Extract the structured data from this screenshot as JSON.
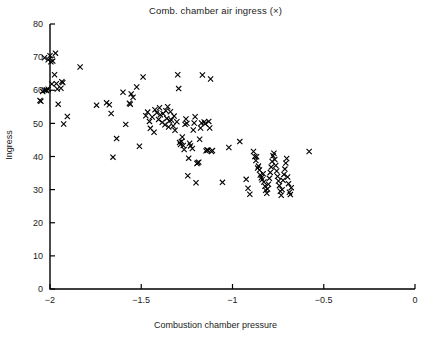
{
  "chart_data": {
    "type": "scatter",
    "title": "Comb. chamber air ingress (×)",
    "xlabel": "Combustion chamber pressure",
    "ylabel": "Ingress",
    "xlim": [
      -2.1,
      0
    ],
    "ylim": [
      0,
      80
    ],
    "xticks": [
      -2,
      -1.5,
      -1,
      -0.5,
      0
    ],
    "xtick_labels": [
      "−2",
      "−1.5",
      "−1",
      "−0.5",
      "0"
    ],
    "yticks": [
      0,
      10,
      20,
      30,
      40,
      50,
      60,
      70,
      80
    ],
    "ytick_labels": [
      "0",
      "10",
      "20",
      "30",
      "40",
      "50",
      "60",
      "70",
      "80"
    ],
    "grid": false,
    "legend": null,
    "marker": "x",
    "marker_color": "#000000",
    "axis_color": "#000000",
    "series": [
      {
        "name": "Comb. chamber air ingress",
        "points": [
          [
            -2.05,
            56.7
          ],
          [
            -2.04,
            59.6
          ],
          [
            -2.03,
            60.0
          ],
          [
            -2.02,
            59.9
          ],
          [
            -2.01,
            60.3
          ],
          [
            -2.03,
            69.8
          ],
          [
            -2.01,
            69.2
          ],
          [
            -2.0,
            70.4
          ],
          [
            -1.995,
            68.6
          ],
          [
            -1.985,
            68.8
          ],
          [
            -1.97,
            71.2
          ],
          [
            -1.975,
            64.7
          ],
          [
            -1.99,
            61.9
          ],
          [
            -1.965,
            62.0
          ],
          [
            -1.96,
            60.4
          ],
          [
            -1.94,
            60.6
          ],
          [
            -1.935,
            62.6
          ],
          [
            -1.93,
            62.3
          ],
          [
            -1.955,
            55.8
          ],
          [
            -1.925,
            49.8
          ],
          [
            -1.905,
            52.1
          ],
          [
            -2.055,
            56.9
          ],
          [
            -2.02,
            60.1
          ],
          [
            -1.835,
            67.0
          ],
          [
            -1.745,
            55.5
          ],
          [
            -1.69,
            56.2
          ],
          [
            -1.675,
            55.6
          ],
          [
            -1.665,
            53.0
          ],
          [
            -1.635,
            45.4
          ],
          [
            -1.655,
            39.8
          ],
          [
            -1.6,
            59.4
          ],
          [
            -1.585,
            49.7
          ],
          [
            -1.565,
            56.1
          ],
          [
            -1.56,
            55.8
          ],
          [
            -1.555,
            58.9
          ],
          [
            -1.545,
            57.9
          ],
          [
            -1.525,
            61.0
          ],
          [
            -1.51,
            43.1
          ],
          [
            -1.49,
            64.0
          ],
          [
            -1.475,
            52.3
          ],
          [
            -1.465,
            53.4
          ],
          [
            -1.455,
            50.6
          ],
          [
            -1.45,
            48.5
          ],
          [
            -1.44,
            51.9
          ],
          [
            -1.43,
            47.3
          ],
          [
            -1.425,
            54.1
          ],
          [
            -1.415,
            53.2
          ],
          [
            -1.405,
            51.2
          ],
          [
            -1.4,
            54.7
          ],
          [
            -1.395,
            52.6
          ],
          [
            -1.385,
            50.3
          ],
          [
            -1.38,
            52.9
          ],
          [
            -1.37,
            49.6
          ],
          [
            -1.365,
            53.8
          ],
          [
            -1.36,
            51.5
          ],
          [
            -1.355,
            55.0
          ],
          [
            -1.35,
            48.9
          ],
          [
            -1.345,
            50.8
          ],
          [
            -1.34,
            53.5
          ],
          [
            -1.335,
            51.0
          ],
          [
            -1.325,
            49.2
          ],
          [
            -1.32,
            52.2
          ],
          [
            -1.315,
            47.9
          ],
          [
            -1.305,
            50.5
          ],
          [
            -1.3,
            64.7
          ],
          [
            -1.295,
            60.5
          ],
          [
            -1.29,
            44.2
          ],
          [
            -1.285,
            43.6
          ],
          [
            -1.28,
            44.5
          ],
          [
            -1.275,
            45.9
          ],
          [
            -1.27,
            43.3
          ],
          [
            -1.265,
            42.1
          ],
          [
            -1.26,
            49.7
          ],
          [
            -1.255,
            51.3
          ],
          [
            -1.25,
            50.0
          ],
          [
            -1.245,
            34.2
          ],
          [
            -1.24,
            39.5
          ],
          [
            -1.235,
            44.0
          ],
          [
            -1.23,
            43.2
          ],
          [
            -1.22,
            42.4
          ],
          [
            -1.215,
            48.0
          ],
          [
            -1.21,
            50.1
          ],
          [
            -1.205,
            52.0
          ],
          [
            -1.2,
            32.1
          ],
          [
            -1.195,
            37.9
          ],
          [
            -1.19,
            38.1
          ],
          [
            -1.185,
            38.3
          ],
          [
            -1.18,
            45.2
          ],
          [
            -1.175,
            48.6
          ],
          [
            -1.17,
            50.1
          ],
          [
            -1.165,
            64.6
          ],
          [
            -1.155,
            50.4
          ],
          [
            -1.15,
            49.9
          ],
          [
            -1.145,
            41.7
          ],
          [
            -1.14,
            42.0
          ],
          [
            -1.135,
            41.9
          ],
          [
            -1.13,
            50.6
          ],
          [
            -1.125,
            48.6
          ],
          [
            -1.12,
            63.4
          ],
          [
            -1.115,
            41.5
          ],
          [
            -1.11,
            41.8
          ],
          [
            -1.055,
            32.2
          ],
          [
            -1.02,
            42.7
          ],
          [
            -0.96,
            44.5
          ],
          [
            -0.925,
            33.1
          ],
          [
            -0.915,
            30.4
          ],
          [
            -0.905,
            28.6
          ],
          [
            -0.885,
            41.5
          ],
          [
            -0.878,
            40.0
          ],
          [
            -0.872,
            38.8
          ],
          [
            -0.868,
            39.9
          ],
          [
            -0.862,
            36.5
          ],
          [
            -0.858,
            37.1
          ],
          [
            -0.852,
            35.9
          ],
          [
            -0.848,
            34.4
          ],
          [
            -0.842,
            33.6
          ],
          [
            -0.838,
            33.0
          ],
          [
            -0.832,
            34.8
          ],
          [
            -0.828,
            32.3
          ],
          [
            -0.822,
            31.0
          ],
          [
            -0.818,
            29.8
          ],
          [
            -0.812,
            28.9
          ],
          [
            -0.808,
            30.2
          ],
          [
            -0.803,
            31.6
          ],
          [
            -0.798,
            33.4
          ],
          [
            -0.793,
            35.2
          ],
          [
            -0.788,
            36.8
          ],
          [
            -0.783,
            38.5
          ],
          [
            -0.778,
            40.2
          ],
          [
            -0.773,
            41.0
          ],
          [
            -0.768,
            39.1
          ],
          [
            -0.763,
            37.3
          ],
          [
            -0.758,
            35.6
          ],
          [
            -0.753,
            34.0
          ],
          [
            -0.748,
            32.6
          ],
          [
            -0.743,
            31.2
          ],
          [
            -0.738,
            29.5
          ],
          [
            -0.733,
            28.3
          ],
          [
            -0.728,
            30.0
          ],
          [
            -0.723,
            32.8
          ],
          [
            -0.718,
            34.6
          ],
          [
            -0.713,
            36.2
          ],
          [
            -0.708,
            38.0
          ],
          [
            -0.703,
            39.4
          ],
          [
            -0.698,
            33.8
          ],
          [
            -0.693,
            31.8
          ],
          [
            -0.688,
            29.2
          ],
          [
            -0.683,
            28.5
          ],
          [
            -0.678,
            30.6
          ],
          [
            -0.58,
            41.5
          ]
        ]
      }
    ]
  }
}
